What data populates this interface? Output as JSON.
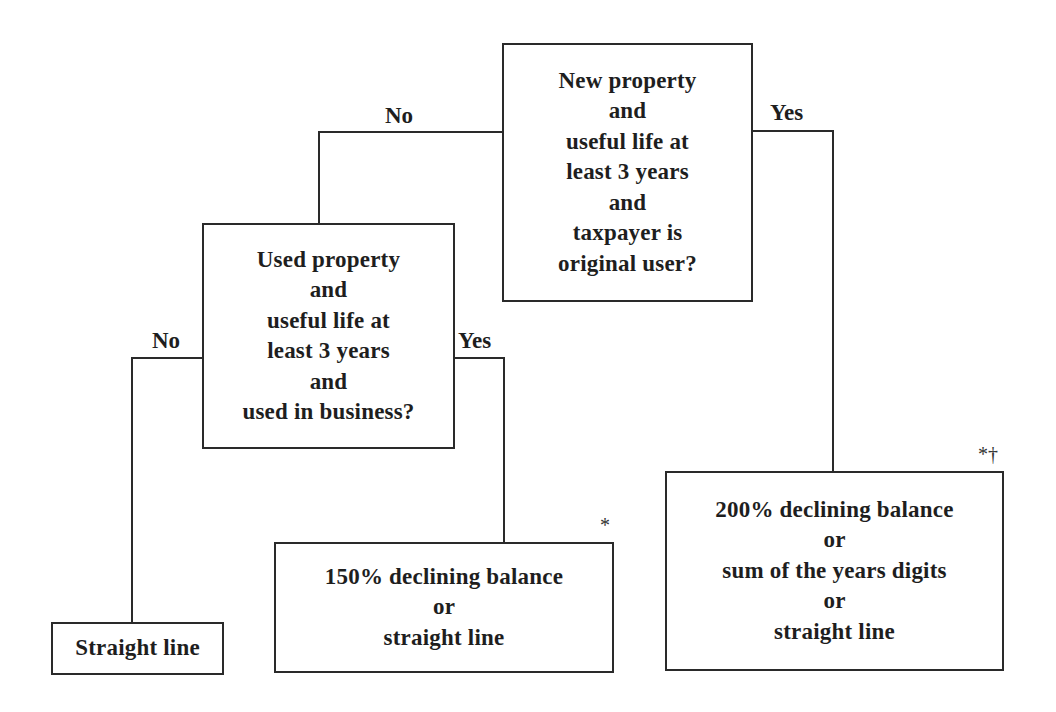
{
  "diagram": {
    "type": "decision-tree",
    "root": {
      "lines": [
        "New property",
        "and",
        "useful life at",
        "least 3 years",
        "and",
        "taxpayer is",
        "original user?"
      ]
    },
    "second_decision": {
      "lines": [
        "Used property",
        "and",
        "useful life at",
        "least 3 years",
        "and",
        "used in business?"
      ]
    },
    "outcomes": {
      "straight_line": {
        "lines": [
          "Straight line"
        ]
      },
      "declining_150": {
        "lines": [
          "150% declining balance",
          "or",
          "straight line"
        ],
        "footnote_mark": "*"
      },
      "declining_200": {
        "lines": [
          "200% declining balance",
          "or",
          "sum of the years digits",
          "or",
          "straight line"
        ],
        "footnote_mark": "*†"
      }
    },
    "edge_labels": {
      "root_no": "No",
      "root_yes": "Yes",
      "second_no": "No",
      "second_yes": "Yes"
    },
    "edges": [
      {
        "from": "root",
        "to": "second_decision",
        "label": "No"
      },
      {
        "from": "root",
        "to": "declining_200",
        "label": "Yes"
      },
      {
        "from": "second_decision",
        "to": "straight_line",
        "label": "No"
      },
      {
        "from": "second_decision",
        "to": "declining_150",
        "label": "Yes"
      }
    ]
  }
}
